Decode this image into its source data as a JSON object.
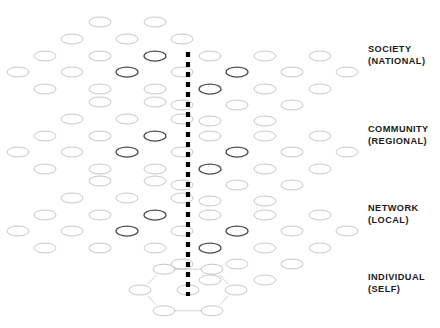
{
  "figure": {
    "background_color": "#ffffff",
    "node_stroke_color": "#b9b9b9",
    "node_stroke_color_dark": "#4a4a4a",
    "edge_color": "#c2c2c2",
    "edge_color_dark": "#6e6e6e",
    "axis_color": "#000000",
    "label_color": "#1b1b1b",
    "node_shape": "ellipse",
    "node_fill": "none",
    "node_rx": 11,
    "node_ry": 5
  },
  "axis": {
    "name": "vertical-dashed-axis",
    "x": 188,
    "y_top": 52,
    "y_bottom": 296,
    "dash_length": 5,
    "gap_length": 5,
    "stroke_width": 4.2
  },
  "layers": [
    {
      "id": "society",
      "label_line1": "SOCIETY",
      "label_line2": "(NATIONAL)",
      "label_x": 368,
      "label_y": 44,
      "origin_y": 8,
      "kind": "lattice"
    },
    {
      "id": "community",
      "label_line1": "COMMUNITY",
      "label_line2": "(REGIONAL)",
      "label_x": 368,
      "label_y": 124,
      "origin_y": 88,
      "kind": "lattice"
    },
    {
      "id": "network",
      "label_line1": "NETWORK",
      "label_line2": "(LOCAL)",
      "label_x": 368,
      "label_y": 203,
      "origin_y": 167,
      "kind": "lattice"
    },
    {
      "id": "individual",
      "label_line1": "INDIVIDUAL",
      "label_line2": "(SELF)",
      "label_x": 368,
      "label_y": 272,
      "origin_y": 262,
      "kind": "single-hexagon"
    }
  ],
  "lattice": {
    "description": "Sheared hexagonal mesh: ellipse nodes on a honeycomb grid, left cluster higher, right cluster stepped down.",
    "col_spacing": 31,
    "row_spacing": 18,
    "shear_per_column": 1.55,
    "nodes": [
      {
        "x": 100,
        "y": 14,
        "bold": false
      },
      {
        "x": 155,
        "y": 14,
        "bold": false
      },
      {
        "x": 72,
        "y": 31,
        "bold": false
      },
      {
        "x": 127,
        "y": 31,
        "bold": false
      },
      {
        "x": 182,
        "y": 31,
        "bold": false
      },
      {
        "x": 45,
        "y": 48,
        "bold": false
      },
      {
        "x": 100,
        "y": 48,
        "bold": false
      },
      {
        "x": 155,
        "y": 48,
        "bold": true
      },
      {
        "x": 210,
        "y": 48,
        "bold": false
      },
      {
        "x": 265,
        "y": 48,
        "bold": false
      },
      {
        "x": 320,
        "y": 48,
        "bold": false
      },
      {
        "x": 18,
        "y": 64,
        "bold": false
      },
      {
        "x": 72,
        "y": 64,
        "bold": false
      },
      {
        "x": 127,
        "y": 64,
        "bold": true
      },
      {
        "x": 182,
        "y": 64,
        "bold": false
      },
      {
        "x": 237,
        "y": 64,
        "bold": true
      },
      {
        "x": 292,
        "y": 64,
        "bold": false
      },
      {
        "x": 347,
        "y": 64,
        "bold": false
      },
      {
        "x": 45,
        "y": 81,
        "bold": false
      },
      {
        "x": 100,
        "y": 81,
        "bold": false
      },
      {
        "x": 155,
        "y": 81,
        "bold": false
      },
      {
        "x": 210,
        "y": 81,
        "bold": true
      },
      {
        "x": 265,
        "y": 81,
        "bold": false
      },
      {
        "x": 320,
        "y": 81,
        "bold": false
      },
      {
        "x": 182,
        "y": 97,
        "bold": false
      },
      {
        "x": 237,
        "y": 97,
        "bold": false
      },
      {
        "x": 292,
        "y": 97,
        "bold": false
      },
      {
        "x": 210,
        "y": 113,
        "bold": false
      },
      {
        "x": 265,
        "y": 113,
        "bold": false
      }
    ]
  },
  "individual_hexagon": {
    "center_x": 188,
    "center_y": 290,
    "ring_radius_x": 48,
    "ring_radius_y": 24,
    "node_count": 7,
    "has_center_node": true
  },
  "summary": {
    "tiers": 4,
    "tier_labels": [
      "SOCIETY (NATIONAL)",
      "COMMUNITY (REGIONAL)",
      "NETWORK (LOCAL)",
      "INDIVIDUAL (SELF)"
    ]
  }
}
